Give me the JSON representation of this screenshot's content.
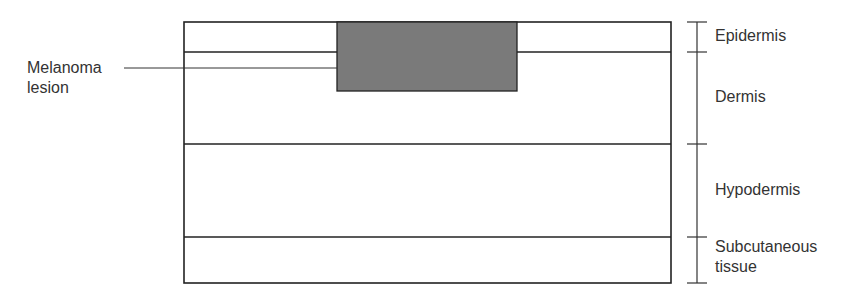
{
  "diagram": {
    "layers": [
      {
        "label": "Epidermis"
      },
      {
        "label": "Dermis"
      },
      {
        "label": "Hypodermis"
      },
      {
        "label": "Subcutaneous tissue"
      }
    ],
    "lesion": {
      "label_line1": "Melanoma",
      "label_line2": "lesion",
      "fill": "#7a7a7a"
    },
    "labels": {
      "epidermis": "Epidermis",
      "dermis": "Dermis",
      "hypodermis": "Hypodermis",
      "subcutaneous_1": "Subcutaneous",
      "subcutaneous_2": "tissue"
    }
  }
}
